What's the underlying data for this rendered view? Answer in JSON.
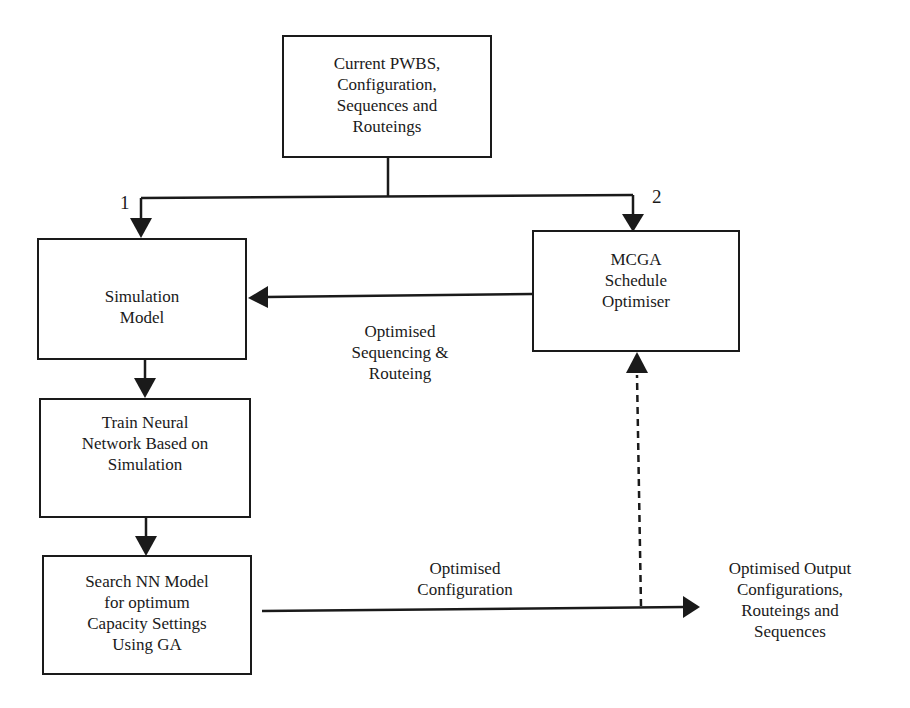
{
  "diagram": {
    "boxes": {
      "input": {
        "lines": [
          "Current PWBS,",
          "Configuration,",
          "Sequences and",
          "Routeings"
        ]
      },
      "simulation": {
        "lines": [
          "Simulation",
          "Model"
        ]
      },
      "mcga": {
        "lines": [
          "MCGA",
          "Schedule",
          "Optimiser"
        ]
      },
      "train_nn": {
        "lines": [
          "Train Neural",
          "Network Based on",
          "Simulation"
        ]
      },
      "search_nn": {
        "lines": [
          "Search NN Model",
          "for optimum",
          "Capacity Settings",
          "Using GA"
        ]
      }
    },
    "branch_labels": {
      "left": "1",
      "right": "2"
    },
    "edge_labels": {
      "sequencing": [
        "Optimised",
        "Sequencing &",
        "Routeing"
      ],
      "configuration": [
        "Optimised",
        "Configuration"
      ]
    },
    "output": {
      "lines": [
        "Optimised Output",
        "Configurations,",
        "Routeings and",
        "Sequences"
      ]
    },
    "colors": {
      "line": "#1a1a1a",
      "background": "#ffffff"
    }
  }
}
